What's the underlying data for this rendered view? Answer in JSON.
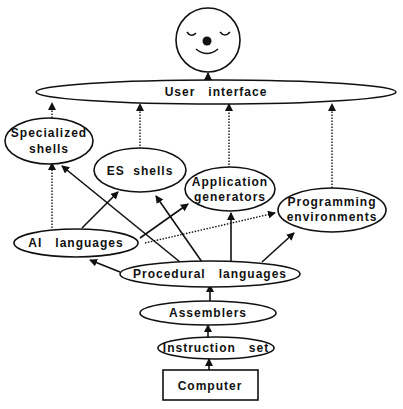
{
  "diagram": {
    "type": "hierarchy",
    "face": {
      "name": "user-face",
      "expression": "smiling, eyes closed"
    },
    "nodes": [
      {
        "id": "user_interface",
        "label": "User   interface",
        "shape": "ellipse"
      },
      {
        "id": "specialized_shells",
        "label_line1": "Specialized",
        "label_line2": "shells",
        "shape": "ellipse"
      },
      {
        "id": "es_shells",
        "label": "ES  shells",
        "shape": "ellipse"
      },
      {
        "id": "application_generators",
        "label_line1": "Application",
        "label_line2": "generators",
        "shape": "ellipse"
      },
      {
        "id": "programming_environments",
        "label_line1": "Programming",
        "label_line2": "environments",
        "shape": "ellipse"
      },
      {
        "id": "ai_languages",
        "label": "AI   languages",
        "shape": "ellipse"
      },
      {
        "id": "procedural_languages",
        "label": "Procedural   languages",
        "shape": "ellipse"
      },
      {
        "id": "assemblers",
        "label": "Assemblers",
        "shape": "ellipse"
      },
      {
        "id": "instruction_set",
        "label": "Instruction   set",
        "shape": "ellipse"
      },
      {
        "id": "computer",
        "label": "Computer",
        "shape": "rectangle"
      }
    ],
    "edges": [
      {
        "from": "computer",
        "to": "instruction_set"
      },
      {
        "from": "instruction_set",
        "to": "assemblers"
      },
      {
        "from": "assemblers",
        "to": "procedural_languages"
      },
      {
        "from": "procedural_languages",
        "to": "ai_languages"
      },
      {
        "from": "procedural_languages",
        "to": "specialized_shells"
      },
      {
        "from": "procedural_languages",
        "to": "es_shells"
      },
      {
        "from": "procedural_languages",
        "to": "application_generators"
      },
      {
        "from": "procedural_languages",
        "to": "programming_environments"
      },
      {
        "from": "ai_languages",
        "to": "specialized_shells"
      },
      {
        "from": "ai_languages",
        "to": "es_shells"
      },
      {
        "from": "ai_languages",
        "to": "application_generators"
      },
      {
        "from": "ai_languages",
        "to": "programming_environments",
        "style": "dotted"
      },
      {
        "from": "specialized_shells",
        "to": "user_interface"
      },
      {
        "from": "es_shells",
        "to": "user_interface"
      },
      {
        "from": "application_generators",
        "to": "user_interface"
      },
      {
        "from": "programming_environments",
        "to": "user_interface"
      },
      {
        "from": "user_interface",
        "to": "user_face"
      }
    ]
  }
}
